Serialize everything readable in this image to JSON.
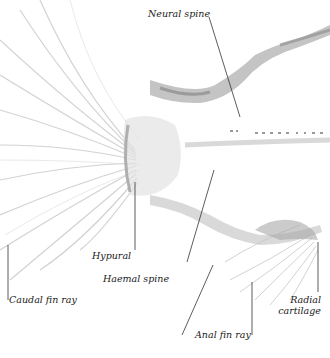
{
  "figure": {
    "background": "#ffffff",
    "ink_color": "#1a1a1a",
    "bone_color": "#9a9a9a"
  },
  "labels": [
    {
      "id": "neural-spine",
      "text": "Neural spine"
    },
    {
      "id": "hypural",
      "text": "Hypural"
    },
    {
      "id": "haemal-spine",
      "text": "Haemal  spine"
    },
    {
      "id": "caudal-fin-ray",
      "text": "Caudal fin ray"
    },
    {
      "id": "anal-fin-ray",
      "text": "Anal fin ray"
    },
    {
      "id": "radial-cartilage-line1",
      "text": "Radial"
    },
    {
      "id": "radial-cartilage-line2",
      "text": "cartilage"
    }
  ]
}
